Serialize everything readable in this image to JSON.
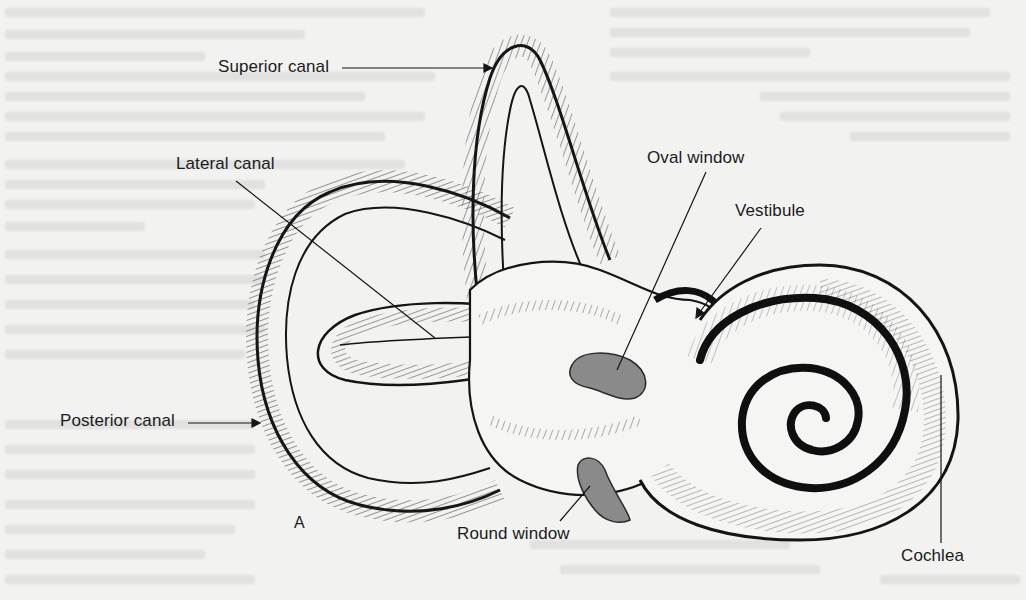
{
  "figure": {
    "panel_label": "A",
    "colors": {
      "ink": "#151515",
      "paper": "#f2f2f1",
      "window_fill": "#8a8a8a"
    },
    "labels": {
      "superior_canal": "Superior canal",
      "lateral_canal": "Lateral canal",
      "posterior_canal": "Posterior canal",
      "oval_window": "Oval window",
      "vestibule": "Vestibule",
      "round_window": "Round window",
      "cochlea": "Cochlea"
    }
  }
}
